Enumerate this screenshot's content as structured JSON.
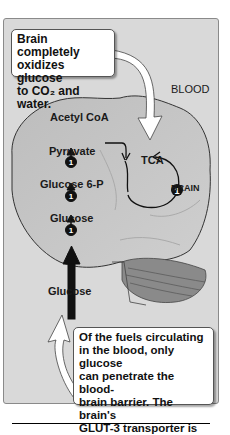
{
  "diagram": {
    "region_labels": {
      "blood": "BLOOD",
      "brain": "BRAIN"
    },
    "pathway": {
      "steps": [
        "Glucose",
        "Glucose 6-P",
        "Pyruvate",
        "Acetyl CoA"
      ],
      "cycle": "TCA",
      "enzyme_marker": "1",
      "input_label": "Glucose"
    },
    "callouts": {
      "top": {
        "lines": [
          "Brain completely",
          "oxidizes glucose",
          "to CO₂ and water."
        ]
      },
      "bottom": {
        "lines": [
          "Of the fuels circulating",
          "in the blood, only glucose",
          "can penetrate the blood-",
          "brain barrier. The brain's",
          "GLUT-3 transporter is",
          "insulin-insensitive."
        ]
      }
    }
  }
}
